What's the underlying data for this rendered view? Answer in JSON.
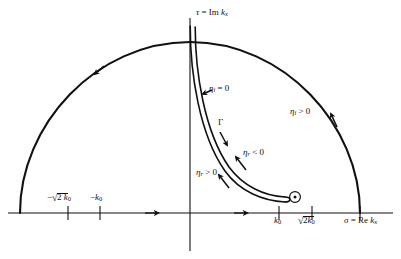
{
  "figure": {
    "name": "complex-k-plane-contour",
    "background": "#ffffff",
    "ink": "#111111"
  },
  "axes": {
    "vertical_label": "τ = Im k",
    "vertical_label_sub": "x",
    "horizontal_label": "σ = Re k",
    "horizontal_label_sub": "x",
    "origin_px": {
      "x": 190,
      "y": 213
    }
  },
  "ticks": [
    {
      "id": "neg-sqrt2-k0",
      "prefix": "−",
      "radical": true,
      "radicand": "2",
      "base": "k",
      "sub": "0",
      "x": 68
    },
    {
      "id": "neg-k0",
      "prefix": "−",
      "radical": false,
      "radicand": "",
      "base": "k",
      "sub": "0",
      "x": 100
    },
    {
      "id": "k0",
      "prefix": "",
      "radical": false,
      "radicand": "",
      "base": "k",
      "sub": "0",
      "x": 279
    },
    {
      "id": "sqrt2-k0",
      "prefix": "",
      "radical": true,
      "radicand": "2",
      "base": "k",
      "sub": "0",
      "x": 312
    },
    {
      "id": "sigma-end",
      "prefix": "",
      "radical": false,
      "radicand": "",
      "base": "",
      "sub": "",
      "x": 360
    }
  ],
  "tick_labels": {
    "neg_sqrt2_k0": "−√2 k₀",
    "neg_k0": "−k₀",
    "k0": "k₀",
    "sqrt2_k0": "√2k₀"
  },
  "annotations": {
    "eta_i_zero": {
      "text": "η",
      "sub": "i",
      "rel": " = 0",
      "x": 209,
      "y": 89
    },
    "eta_i_gt": {
      "text": "η",
      "sub": "i",
      "rel": " > 0",
      "x": 292,
      "y": 108
    },
    "contour": {
      "text": "Γ",
      "x": 219,
      "y": 123
    },
    "eta_r_lt": {
      "text": "η",
      "sub": "r",
      "rel": " < 0",
      "x": 243,
      "y": 152
    },
    "eta_r_gt": {
      "text": "η",
      "sub": "r",
      "rel": " > 0",
      "x": 197,
      "y": 172
    }
  },
  "markers": {
    "pole": {
      "name": "pole-circled-dot",
      "glyph": "⊙",
      "x": 295,
      "y": 197
    }
  },
  "contour_geometry": {
    "arc": {
      "left_x": 20,
      "right_x": 360,
      "baseline_y": 213,
      "apex_y": 42
    },
    "branch_cut": {
      "top_x": 192,
      "top_y": 26,
      "tip_x": 287,
      "tip_y": 200,
      "gap_px": 4
    },
    "direction_arrows": [
      {
        "name": "arrow-arc-upper-left",
        "x": 97,
        "y": 72,
        "angle": 205
      },
      {
        "name": "arrow-arc-right",
        "x": 332,
        "y": 116,
        "angle": 300
      },
      {
        "name": "arrow-axis-left",
        "x": 155,
        "y": 213,
        "angle": 0
      },
      {
        "name": "arrow-axis-right",
        "x": 244,
        "y": 213,
        "angle": 0
      },
      {
        "name": "arrow-cut-inner-upper",
        "x": 206,
        "y": 93,
        "angle": 200
      },
      {
        "name": "arrow-cut-down-1",
        "x": 226,
        "y": 141,
        "angle": 58
      },
      {
        "name": "arrow-cut-up-1",
        "x": 239,
        "y": 160,
        "angle": 238
      },
      {
        "name": "arrow-cut-up-2",
        "x": 222,
        "y": 178,
        "angle": 238
      }
    ]
  }
}
